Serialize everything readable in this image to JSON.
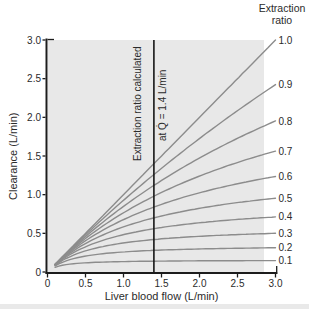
{
  "figure": {
    "legend_title_line1": "Extraction",
    "legend_title_line2": "ratio",
    "annotation_line1": "Extraction ratio calculated",
    "annotation_line2": "at Q̇ = 1.4 L/min"
  },
  "chart_data": {
    "type": "line",
    "title": "",
    "xlabel": "Liver blood flow (L/min)",
    "ylabel": "Clearance (L/min)",
    "xlim": [
      0,
      3.0
    ],
    "ylim": [
      0,
      3.0
    ],
    "x_ticks": [
      "0",
      "0.5",
      "1.0",
      "1.5",
      "2.0",
      "2.5",
      "3.0"
    ],
    "y_ticks": [
      "0",
      "0.5",
      "1.0",
      "1.5",
      "2.0",
      "2.5",
      "3.0"
    ],
    "grid": false,
    "legend_title": "Extraction ratio",
    "legend_position": "right-of-curve-ends",
    "reference_flow": 1.4,
    "reference_line_x": 1.4,
    "annotation": "Extraction ratio calculated at Q̇ = 1.4 L/min",
    "curve_x_start": 0.1,
    "model": "CL(Q) = Q*Clint/(Q+Clint), with Clint = 1.4*E/(1-E), where E is the extraction ratio at Q = 1.4 L/min (E = 1.0 gives CL = Q)",
    "sample_x": [
      0.1,
      0.5,
      1.0,
      1.4,
      2.0,
      3.0
    ],
    "series": [
      {
        "label": "1.0",
        "extraction_ratio": 1.0,
        "values": [
          0.1,
          0.5,
          1.0,
          1.4,
          2.0,
          3.0
        ]
      },
      {
        "label": "0.9",
        "extraction_ratio": 0.9,
        "values": [
          0.099,
          0.481,
          0.926,
          1.26,
          1.726,
          2.423
        ]
      },
      {
        "label": "0.8",
        "extraction_ratio": 0.8,
        "values": [
          0.098,
          0.459,
          0.848,
          1.12,
          1.474,
          1.953
        ]
      },
      {
        "label": "0.7",
        "extraction_ratio": 0.7,
        "values": [
          0.097,
          0.434,
          0.766,
          0.98,
          1.241,
          1.564
        ]
      },
      {
        "label": "0.6",
        "extraction_ratio": 0.6,
        "values": [
          0.095,
          0.404,
          0.677,
          0.84,
          1.024,
          1.235
        ]
      },
      {
        "label": "0.5",
        "extraction_ratio": 0.5,
        "values": [
          0.093,
          0.368,
          0.583,
          0.7,
          0.824,
          0.955
        ]
      },
      {
        "label": "0.4",
        "extraction_ratio": 0.4,
        "values": [
          0.09,
          0.326,
          0.483,
          0.56,
          0.636,
          0.712
        ]
      },
      {
        "label": "0.3",
        "extraction_ratio": 0.3,
        "values": [
          0.086,
          0.273,
          0.375,
          0.42,
          0.462,
          0.5
        ]
      },
      {
        "label": "0.2",
        "extraction_ratio": 0.2,
        "values": [
          0.078,
          0.206,
          0.259,
          0.28,
          0.298,
          0.313
        ]
      },
      {
        "label": "0.1",
        "extraction_ratio": 0.1,
        "values": [
          0.061,
          0.119,
          0.135,
          0.14,
          0.144,
          0.148
        ]
      }
    ],
    "colors": {
      "plot_background": "#e8e8e8",
      "curve": "#8c8c8c",
      "axis": "#1c1c1c",
      "reference_line": "#161616",
      "text": "#2b2b2b"
    }
  }
}
